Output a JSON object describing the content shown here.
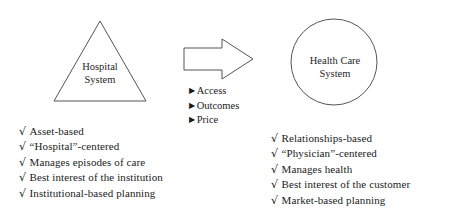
{
  "diagram": {
    "colors": {
      "stroke": "#555555",
      "text": "#1a1a1a",
      "background": "#ffffff"
    },
    "left_node": {
      "shape": "triangle",
      "label_line1": "Hospital",
      "label_line2": "System"
    },
    "arrow": {
      "shape": "block-arrow",
      "direction": "right",
      "drivers": [
        "Access",
        "Outcomes",
        "Price"
      ],
      "bullet_glyph": "▶"
    },
    "right_node": {
      "shape": "circle",
      "label_line1": "Health Care",
      "label_line2": "System"
    },
    "left_attributes": {
      "check_glyph": "√",
      "items": [
        "Asset-based",
        "“Hospital”-centered",
        "Manages episodes of care",
        "Best interest of the institution",
        "Institutional-based planning"
      ]
    },
    "right_attributes": {
      "check_glyph": "√",
      "items": [
        "Relationships-based",
        "“Physician”-centered",
        "Manages health",
        "Best interest of the customer",
        "Market-based planning"
      ]
    }
  }
}
